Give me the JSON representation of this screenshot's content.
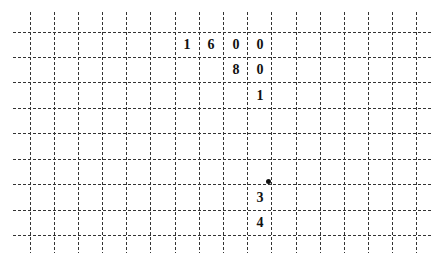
{
  "grid": {
    "line_color": "#333333",
    "vertical_x": [
      30,
      54,
      78,
      102,
      126,
      150,
      175,
      199,
      223,
      247,
      271,
      296,
      320,
      344,
      368,
      392,
      416
    ],
    "horizontal_y": [
      32,
      57,
      82,
      108,
      133,
      159,
      184,
      210,
      235
    ],
    "h_extent": [
      13,
      432
    ],
    "v_extent": [
      12,
      253
    ]
  },
  "cells": [
    {
      "text": "1",
      "cx": 187,
      "cy": 45
    },
    {
      "text": "6",
      "cx": 211,
      "cy": 45
    },
    {
      "text": "0",
      "cx": 236,
      "cy": 45
    },
    {
      "text": "0",
      "cx": 260,
      "cy": 45
    },
    {
      "text": "8",
      "cx": 236,
      "cy": 70
    },
    {
      "text": "0",
      "cx": 260,
      "cy": 70
    },
    {
      "text": "1",
      "cx": 260,
      "cy": 96
    },
    {
      "text": "3",
      "cx": 260,
      "cy": 198
    },
    {
      "text": "4",
      "cx": 260,
      "cy": 223
    }
  ],
  "dot": {
    "cx": 268,
    "cy": 181
  }
}
